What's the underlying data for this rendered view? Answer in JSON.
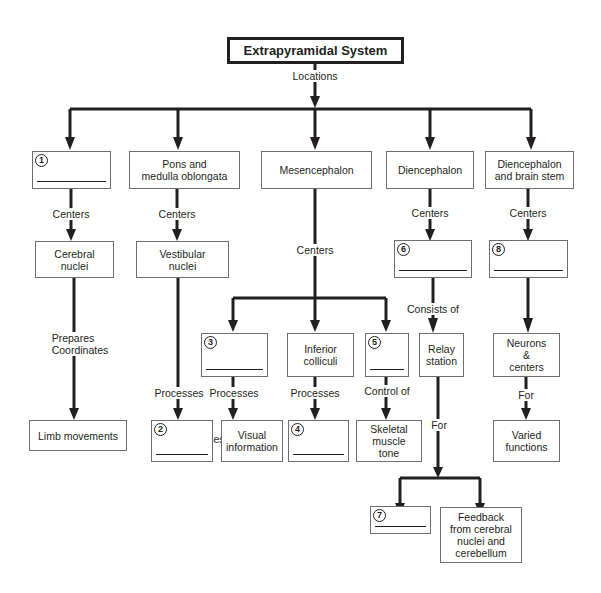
{
  "title": "Extrapyramidal System",
  "edge_labels": {
    "locations": "Locations",
    "centers": "Centers",
    "prepares": "Prepares",
    "coordinates": "Coordinates",
    "processes": "Processes",
    "control_of": "Control of",
    "consists_of": "Consists of",
    "for": "For"
  },
  "locations": [
    {
      "id": "loc-1",
      "blank_number": "1",
      "label": ""
    },
    {
      "id": "loc-pons",
      "label_line1": "Pons and",
      "label_line2": "medulla oblongata"
    },
    {
      "id": "loc-mesencephalon",
      "label": "Mesencephalon"
    },
    {
      "id": "loc-diencephalon",
      "label": "Diencephalon"
    },
    {
      "id": "loc-dien-brainstem",
      "label_line1": "Diencephalon",
      "label_line2": "and brain stem"
    }
  ],
  "centers": {
    "cerebral_nuclei": {
      "line1": "Cerebral",
      "line2": "nuclei"
    },
    "vestibular_nuclei": {
      "line1": "Vestibular",
      "line2": "nuclei"
    },
    "inferior_colliculi": {
      "line1": "Inferior",
      "line2": "colliculi"
    },
    "relay_station": {
      "line1": "Relay",
      "line2": "station"
    },
    "neurons_centers": {
      "line1": "Neurons",
      "line2": "&",
      "line3": "centers"
    }
  },
  "outcomes": {
    "limb_movements": "Limb movements",
    "visual_information": {
      "line1": "Visual",
      "line2": "information"
    },
    "skeletal_muscle_tone": {
      "line1": "Skeletal",
      "line2": "muscle",
      "line3": "tone"
    },
    "varied_functions": {
      "line1": "Varied",
      "line2": "functions"
    },
    "feedback": {
      "line1": "Feedback",
      "line2": "from cerebral",
      "line3": "nuclei and",
      "line4": "cerebellum"
    }
  },
  "blanks": {
    "b1": "1",
    "b2": "2",
    "b3": "3",
    "b4": "4",
    "b5": "5",
    "b6": "6",
    "b7": "7",
    "b8": "8"
  },
  "colors": {
    "line": "#231f20",
    "box_border": "#6d6e71",
    "background": "#ffffff"
  }
}
